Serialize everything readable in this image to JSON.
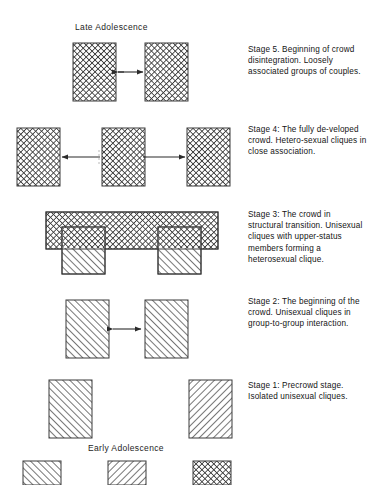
{
  "figure": {
    "title_top": "Late Adolescence",
    "title_bottom": "Early Adolescence",
    "background_color": "#ffffff",
    "ink_color": "#2b2b2b"
  },
  "stages": [
    {
      "id": "stage5",
      "caption": "Stage 5.  Beginning of crowd disintegration. Loosely associated groups of couples.",
      "group_count": 2,
      "pattern": "crosshatch",
      "arrows": 1
    },
    {
      "id": "stage4",
      "caption": "Stage 4:  The fully de-veloped crowd.  Hetero-sexual cliques in close association.",
      "group_count": 3,
      "pattern": "crosshatch",
      "arrows": 2
    },
    {
      "id": "stage3",
      "caption": "Stage 3:  The crowd in structural transition. Unisexual cliques with upper-status members forming a heterosexual clique.",
      "group_count": 3,
      "pattern": "crosshatch-over-diagonal",
      "arrows": 0
    },
    {
      "id": "stage2",
      "caption": "Stage 2:  The beginning of the crowd.  Unisexual cliques in group-to-group interaction.",
      "group_count": 2,
      "pattern": "diagonal",
      "arrows": 1
    },
    {
      "id": "stage1",
      "caption": "Stage 1:  Precrowd stage.  Isolated unisexual cliques.",
      "group_count": 2,
      "pattern": "diagonal",
      "arrows": 0
    }
  ],
  "legend": {
    "swatches": [
      {
        "pattern": "diagonal-forward",
        "meaning": "unisexual clique"
      },
      {
        "pattern": "diagonal-backward",
        "meaning": "unisexual clique"
      },
      {
        "pattern": "crosshatch",
        "meaning": "heterosexual clique"
      }
    ]
  }
}
